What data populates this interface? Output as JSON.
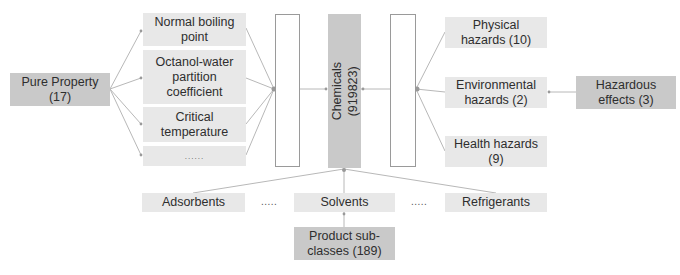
{
  "diagram": {
    "colors": {
      "dark_box": "#c9c9c9",
      "light_box": "#e8e8e8",
      "connector": "#b5b5b5",
      "text": "#2e2e2e"
    },
    "left": {
      "root": {
        "label_line1": "Pure Property",
        "label_line2": "(17)"
      },
      "children": [
        {
          "label": "Normal boiling point"
        },
        {
          "label": "Octanol-water partition coefficient"
        },
        {
          "label": "Critical temperature"
        },
        {
          "label": "......"
        }
      ]
    },
    "center": {
      "label_line1": "Chemicals",
      "label_line2": "(919823)"
    },
    "right": {
      "children": [
        {
          "label": "Physical hazards (10)"
        },
        {
          "label": "Environmental hazards (2)"
        },
        {
          "label": "Health hazards (9)"
        }
      ],
      "root": {
        "label_line1": "Hazardous",
        "label_line2": "effects (3)"
      }
    },
    "bottom": {
      "children": [
        {
          "label": "Adsorbents"
        },
        {
          "label": "....."
        },
        {
          "label": "Solvents"
        },
        {
          "label": "....."
        },
        {
          "label": "Refrigerants"
        }
      ],
      "root": {
        "label_line1": "Product sub-",
        "label_line2": "classes (189)"
      }
    }
  }
}
